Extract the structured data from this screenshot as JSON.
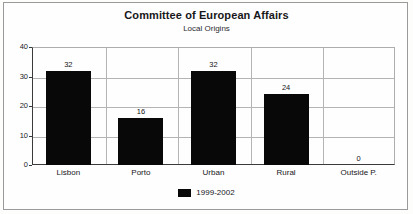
{
  "chart_data": {
    "type": "bar",
    "title": "Committee of European Affairs",
    "subtitle": "Local Origins",
    "xlabel": "",
    "ylabel": "",
    "categories": [
      "Lisbon",
      "Porto",
      "Urban",
      "Rural",
      "Outside P."
    ],
    "values": [
      32,
      16,
      32,
      24,
      0
    ],
    "series": [
      {
        "name": "1999-2002",
        "values": [
          32,
          16,
          32,
          24,
          0
        ]
      }
    ],
    "ylim": [
      0,
      40
    ],
    "yticks": [
      0,
      10,
      20,
      30,
      40
    ],
    "ytick_labels": [
      "0",
      "10",
      "20",
      "30",
      "40"
    ],
    "value_labels": [
      "32",
      "16",
      "32",
      "24",
      "0"
    ],
    "grid": true,
    "grid_orientation": "both",
    "legend": [
      "1999-2002"
    ],
    "legend_position": "bottom-center",
    "bar_color": "#080808",
    "show_value_labels": true
  }
}
